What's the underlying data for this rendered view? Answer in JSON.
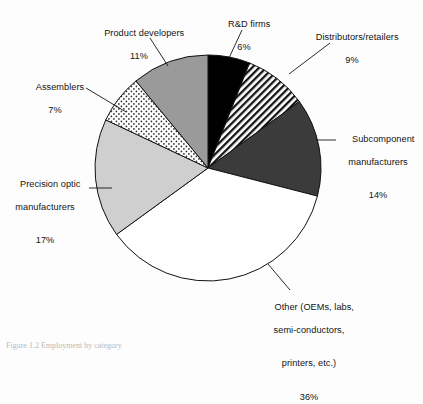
{
  "figure": {
    "background_color": "#fdfdfd",
    "caption": "Figure 1.2 Employment by category"
  },
  "chart_data": {
    "type": "pie",
    "title": "",
    "xlabel": "",
    "ylabel": "",
    "units": "percent",
    "start_angle_deg": 0,
    "direction": "clockwise",
    "legend": "none (direct labels with leader lines)",
    "grid": false,
    "center": {
      "cx": 208,
      "cy": 168,
      "r": 113
    },
    "categories": [
      "R&D firms",
      "Distributors/retailers",
      "Subcomponent manufacturers",
      "Other (OEMs, labs, semi-conductors, printers, etc.)",
      "Precision optic manufacturers",
      "Assemblers",
      "Product developers"
    ],
    "values": [
      6,
      9,
      14,
      36,
      17,
      7,
      11
    ],
    "slices": [
      {
        "name": "R&D firms",
        "value": 6,
        "pct_label": "6%",
        "fill": "#000000",
        "pattern": "solid-black",
        "start_pct": 0,
        "end_pct": 6
      },
      {
        "name": "Distributors/retailers",
        "value": 9,
        "pct_label": "9%",
        "fill": "#ffffff",
        "pattern": "diagonal-hatch",
        "start_pct": 6,
        "end_pct": 15
      },
      {
        "name": "Subcomponent manufacturers",
        "value": 14,
        "pct_label": "14%",
        "fill": "#3b3b3b",
        "pattern": "solid-dark-gray",
        "start_pct": 15,
        "end_pct": 29
      },
      {
        "name": "Other",
        "value": 36,
        "pct_label": "36%",
        "fill": "#ffffff",
        "pattern": "solid-white",
        "start_pct": 29,
        "end_pct": 65
      },
      {
        "name": "Precision optic manufacturers",
        "value": 17,
        "pct_label": "17%",
        "fill": "#cfcfcf",
        "pattern": "solid-light-gray",
        "start_pct": 65,
        "end_pct": 82
      },
      {
        "name": "Assemblers",
        "value": 7,
        "pct_label": "7%",
        "fill": "#ffffff",
        "pattern": "dotted-stipple",
        "start_pct": 82,
        "end_pct": 89
      },
      {
        "name": "Product developers",
        "value": 11,
        "pct_label": "11%",
        "fill": "#9a9a9a",
        "pattern": "solid-mid-gray",
        "start_pct": 89,
        "end_pct": 100
      }
    ]
  },
  "labels": {
    "rd_firms": {
      "line1": "R&D firms",
      "pct": "6%"
    },
    "distributors": {
      "line1": "Distributors/retailers",
      "pct": "9%"
    },
    "subcomponent": {
      "line1": "Subcomponent",
      "line2": "manufacturers",
      "pct": "14%"
    },
    "other": {
      "line1": "Other (OEMs, labs,",
      "line2": "semi-conductors,",
      "line3": "printers, etc.)",
      "pct": "36%"
    },
    "precision_optic": {
      "line1": "Precision optic",
      "line2": "manufacturers",
      "pct": "17%"
    },
    "assemblers": {
      "line1": "Assemblers",
      "pct": "7%"
    },
    "product_dev": {
      "line1": "Product developers",
      "pct": "11%"
    }
  }
}
